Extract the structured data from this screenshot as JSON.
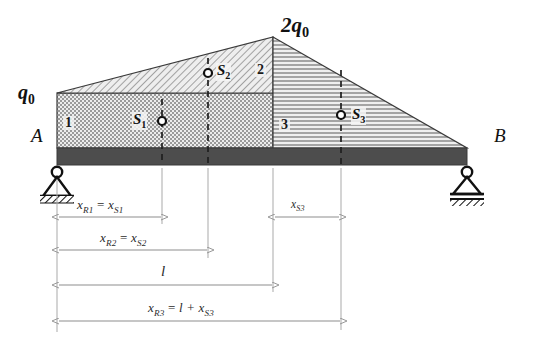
{
  "diagram": {
    "type": "beam-load-diagram",
    "supports": {
      "left": {
        "label": "A",
        "kind": "pin-support"
      },
      "right": {
        "label": "B",
        "kind": "roller-support"
      }
    },
    "load_labels": {
      "left_intensity": "q",
      "left_intensity_sub": "0",
      "apex_intensity": "2q",
      "apex_intensity_sub": "0"
    },
    "regions": [
      {
        "id": "1",
        "label": "1",
        "hatch": "checker",
        "shape": "rectangle"
      },
      {
        "id": "2",
        "label": "2",
        "hatch": "diagonal",
        "shape": "triangle"
      },
      {
        "id": "3",
        "label": "3",
        "hatch": "horizontal",
        "shape": "triangle"
      }
    ],
    "centroids": [
      {
        "id": "S1",
        "label": "S",
        "sub": "1"
      },
      {
        "id": "S2",
        "label": "S",
        "sub": "2"
      },
      {
        "id": "S3",
        "label": "S",
        "sub": "3"
      }
    ],
    "dimensions": [
      {
        "id": "xR1",
        "text_parts": {
          "a": "x",
          "a_sub": "R1",
          "op": " = ",
          "b": "x",
          "b_sub": "S1"
        }
      },
      {
        "id": "xS3",
        "text_parts": {
          "a": "x",
          "a_sub": "S3",
          "op": "",
          "b": "",
          "b_sub": ""
        }
      },
      {
        "id": "xR2",
        "text_parts": {
          "a": "x",
          "a_sub": "R2",
          "op": " = ",
          "b": "x",
          "b_sub": "S2"
        }
      },
      {
        "id": "l",
        "text_parts": {
          "a": "l",
          "a_sub": "",
          "op": "",
          "b": "",
          "b_sub": ""
        }
      },
      {
        "id": "xR3",
        "text_parts": {
          "a": "x",
          "a_sub": "R3",
          "op": " = ",
          "b": "l + x",
          "b_sub": "S3"
        }
      }
    ],
    "colors": {
      "beam": "#4d4d4d",
      "outline": "#3a3a3a",
      "hatch": "#666666",
      "fill_light": "#e8e8e8",
      "dimension": "#8d8d8d",
      "text": "#111111"
    }
  }
}
